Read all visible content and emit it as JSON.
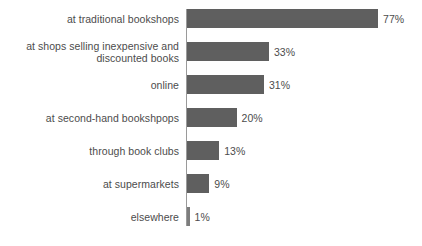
{
  "chart_data": {
    "type": "bar",
    "orientation": "horizontal",
    "title": "",
    "subtitle": "",
    "xlabel": "",
    "ylabel": "",
    "xlim": [
      0,
      77
    ],
    "grid": false,
    "legend": null,
    "value_suffix": "%",
    "categories": [
      "at traditional bookshops",
      "at shops selling inexpensive and\ndiscounted books",
      "online",
      "at second-hand bookshpops",
      "through book clubs",
      "at supermarkets",
      "elsewhere"
    ],
    "values": [
      77,
      33,
      31,
      20,
      13,
      9,
      1
    ],
    "value_labels": [
      "77%",
      "33%",
      "31%",
      "20%",
      "13%",
      "9%",
      "1%"
    ],
    "colors": {
      "bar": "#5f5f5f",
      "bar_sliver": "#7d7d7d",
      "axis": "#9a9a9a",
      "text": "#4c4c4c",
      "background": "#ffffff"
    }
  }
}
